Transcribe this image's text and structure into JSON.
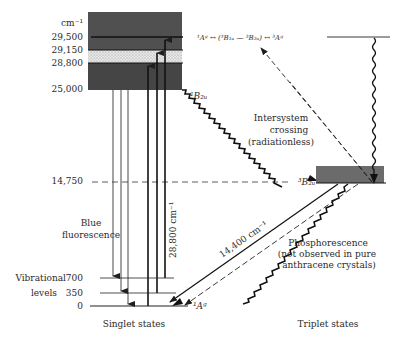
{
  "diagram": {
    "unit_label": "cm⁻¹",
    "energy_ticks": [
      {
        "value": "29,500",
        "y": 37
      },
      {
        "value": "29,150",
        "y": 50
      },
      {
        "value": "28,800",
        "y": 63
      },
      {
        "value": "25,000",
        "y": 89
      },
      {
        "value": "14,750",
        "y": 181
      }
    ],
    "vibrational": {
      "label_line1": "Vibrational",
      "label_line2": "levels",
      "levels": [
        {
          "value": "700",
          "y": 278
        },
        {
          "value": "350",
          "y": 293
        },
        {
          "value": "0",
          "y": 306
        }
      ]
    },
    "state_labels": {
      "singlet_excited": "¹B₂ᵤ",
      "triplet": "³B₂ᵤ",
      "ground_singlet": "¹Aᵍ",
      "upper_chain": "¹Aᵍ ↔ (³B₁ᵤ — ³B₂ᵤ) ↔ ³Aᵍ"
    },
    "annotations": {
      "isc_line1": "Intersystem",
      "isc_line2": "crossing",
      "isc_line3": "(radiationless)",
      "fluor_line1": "Blue",
      "fluor_line2": "fluorescence",
      "absorption_energy": "28,800 cm⁻¹",
      "phos_energy": "14,400 cm⁻¹",
      "phos_line1": "Phosphorescence",
      "phos_line2": "(not observed in pure",
      "phos_line3": "anthracene crystals)"
    },
    "footer": {
      "singlet": "Singlet states",
      "triplet": "Triplet states"
    },
    "colors": {
      "band_dark": "#4a4a4a",
      "band_stipple": "#d8d8d8",
      "triplet_box": "#6e6e6e",
      "line": "#1e1e1e"
    }
  }
}
